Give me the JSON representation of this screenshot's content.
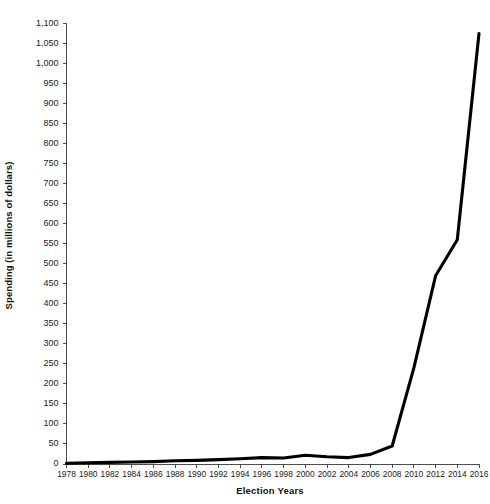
{
  "chart_data": {
    "type": "line",
    "title": "",
    "xlabel": "Election Years",
    "ylabel": "Spending (in millions of dollars)",
    "grid": false,
    "legend": "none",
    "xlim": [
      1978,
      2016
    ],
    "ylim": [
      0,
      1100
    ],
    "ytick_step": 50,
    "xtick_step": 2,
    "categories": [
      "1978",
      "1980",
      "1982",
      "1984",
      "1986",
      "1988",
      "1990",
      "1992",
      "1994",
      "1996",
      "1998",
      "2000",
      "2002",
      "2004",
      "2006",
      "2008",
      "2010",
      "2012",
      "2014",
      "2016"
    ],
    "x": [
      1978,
      1980,
      1982,
      1984,
      1986,
      1988,
      1990,
      1992,
      1994,
      1996,
      1998,
      2000,
      2002,
      2004,
      2006,
      2008,
      2010,
      2012,
      2014,
      2016
    ],
    "ytick_labels": [
      "0",
      "50",
      "100",
      "150",
      "200",
      "250",
      "300",
      "350",
      "400",
      "450",
      "500",
      "550",
      "600",
      "650",
      "700",
      "750",
      "800",
      "850",
      "900",
      "950",
      "1,000",
      "1,050",
      "1,100"
    ],
    "ytick_values": [
      0,
      50,
      100,
      150,
      200,
      250,
      300,
      350,
      400,
      450,
      500,
      550,
      600,
      650,
      700,
      750,
      800,
      850,
      900,
      950,
      1000,
      1050,
      1100
    ],
    "series": [
      {
        "name": "Spending",
        "color": "#000000",
        "values": [
          2,
          3,
          4,
          5,
          6,
          8,
          9,
          11,
          13,
          16,
          15,
          22,
          18,
          16,
          24,
          45,
          240,
          470,
          560,
          1075
        ]
      }
    ]
  },
  "axes": {
    "y_title": "Spending (in millions of dollars)",
    "x_title": "Election Years"
  }
}
